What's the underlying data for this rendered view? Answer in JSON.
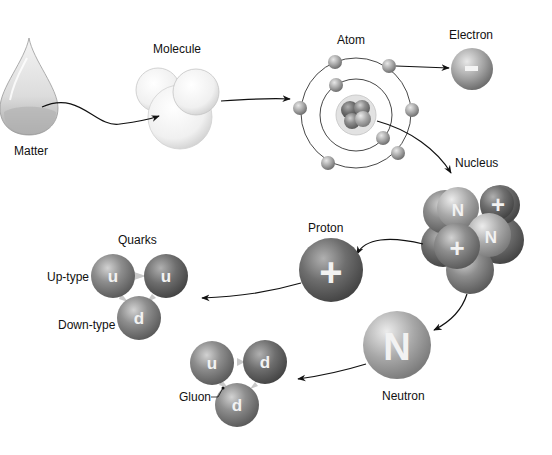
{
  "diagram": {
    "nodes": {
      "matter": {
        "label": "Matter"
      },
      "molecule": {
        "label": "Molecule"
      },
      "atom": {
        "label": "Atom"
      },
      "electron": {
        "label": "Electron",
        "symbol": "-"
      },
      "nucleus": {
        "label": "Nucleus",
        "symbols": [
          "N",
          "+",
          "N",
          "+"
        ]
      },
      "proton": {
        "label": "Proton",
        "symbol": "+"
      },
      "neutron": {
        "label": "Neutron",
        "symbol": "N"
      },
      "proton_quarks": {
        "label": "Quarks",
        "up_label": "Up-type",
        "down_label": "Down-type",
        "quarks": [
          "u",
          "u",
          "d"
        ]
      },
      "neutron_quarks": {
        "gluon_label": "Gluon",
        "quarks": [
          "u",
          "d",
          "d"
        ]
      }
    },
    "edges": [
      {
        "from": "Matter",
        "to": "Molecule"
      },
      {
        "from": "Molecule",
        "to": "Atom"
      },
      {
        "from": "Atom",
        "to": "Electron"
      },
      {
        "from": "Atom",
        "to": "Nucleus"
      },
      {
        "from": "Nucleus",
        "to": "Proton"
      },
      {
        "from": "Nucleus",
        "to": "Neutron"
      },
      {
        "from": "Proton",
        "to": "Quarks (u,u,d)"
      },
      {
        "from": "Neutron",
        "to": "Quarks (u,d,d)"
      }
    ],
    "colors": {
      "particle": "#8a8a8a",
      "particle_dark": "#5e5e5e",
      "particle_light": "#c4c4c4",
      "line": "#111111"
    }
  }
}
